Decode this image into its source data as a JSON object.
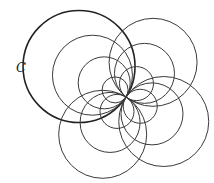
{
  "diagram": {
    "label": "C",
    "label_position": [
      16,
      72
    ],
    "common_point": [
      126,
      97
    ],
    "stroke_color": "#3a3a3a",
    "main_stroke_color": "#222222",
    "families": [
      {
        "name": "upper-left",
        "angle_deg": 213,
        "radii": [
          56,
          40,
          26,
          13
        ],
        "main_index": 0
      },
      {
        "name": "upper-right",
        "angle_deg": -52,
        "radii": [
          44,
          30,
          17
        ]
      },
      {
        "name": "lower-right",
        "angle_deg": 33,
        "radii": [
          45,
          31,
          17
        ]
      },
      {
        "name": "lower-left",
        "angle_deg": 122,
        "radii": [
          44,
          30,
          17
        ]
      }
    ]
  }
}
